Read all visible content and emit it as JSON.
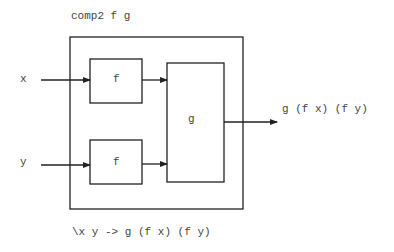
{
  "diagram": {
    "title": "comp2 f g",
    "footer": "\\x y -> g (f x) (f y)",
    "inputs": [
      {
        "label": "x"
      },
      {
        "label": "y"
      }
    ],
    "blocks": {
      "f_top": {
        "label": "f"
      },
      "f_bottom": {
        "label": "f"
      },
      "g": {
        "label": "g"
      }
    },
    "output": {
      "label": "g (f x) (f y)"
    },
    "colors": {
      "stroke": "#222222",
      "text": "#444444",
      "background": "#ffffff"
    }
  }
}
